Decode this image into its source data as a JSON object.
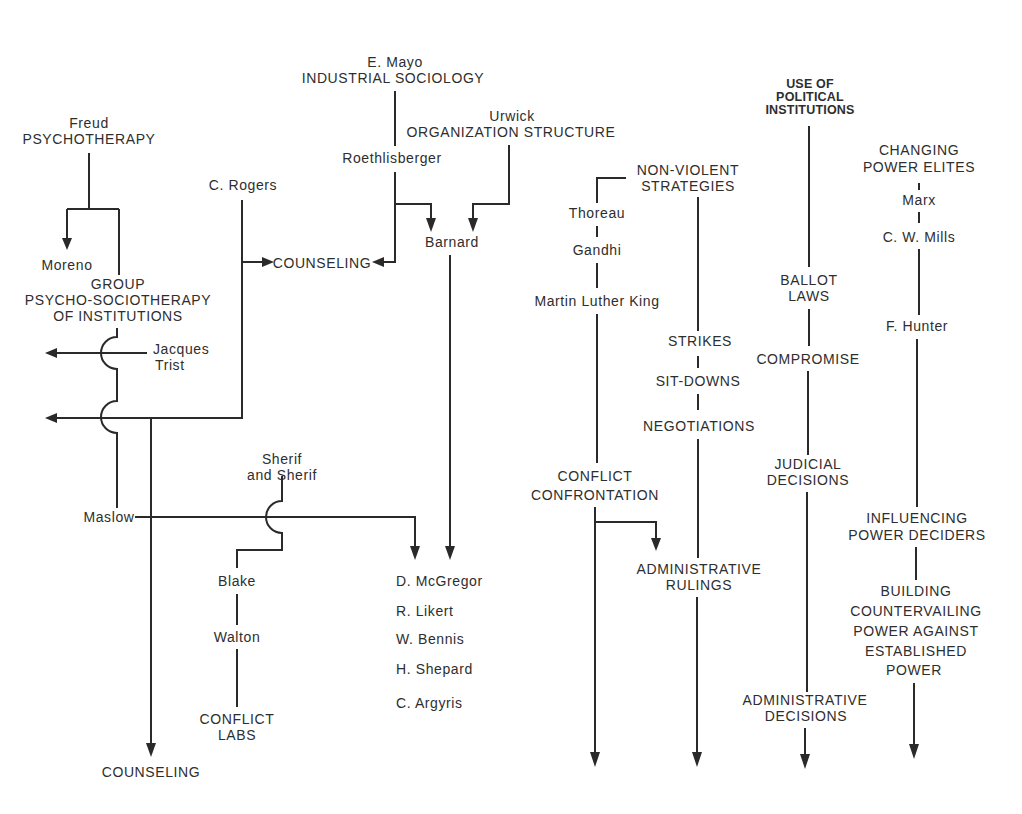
{
  "psychotherapy": {
    "origin_name": "Freud",
    "origin_field": "PSYCHOTHERAPY",
    "moreno": "Moreno",
    "group": [
      "GROUP",
      "PSYCHO-SOCIOTHERAPY",
      "OF INSTITUTIONS"
    ],
    "jacques_trist": [
      "Jacques",
      "Trist"
    ],
    "maslow": "Maslow",
    "counseling_bottom": "COUNSELING"
  },
  "rogers": {
    "name": "C. Rogers",
    "counseling": "COUNSELING"
  },
  "industrial_sociology": {
    "origin_name": "E. Mayo",
    "origin_field": "INDUSTRIAL SOCIOLOGY",
    "roethlisberger": "Roethlisberger"
  },
  "organization_structure": {
    "origin_name": "Urwick",
    "origin_field": "ORGANIZATION STRUCTURE",
    "barnard": "Barnard"
  },
  "conflict_labs": {
    "sherif": [
      "Sherif",
      "and Sherif"
    ],
    "blake": "Blake",
    "walton": "Walton",
    "outcome": [
      "CONFLICT",
      "LABS"
    ]
  },
  "human_relations_list": [
    "D. McGregor",
    "R. Likert",
    "W. Bennis",
    "H. Shepard",
    "C. Argyris"
  ],
  "non_violent": {
    "title": [
      "NON-VIOLENT",
      "STRATEGIES"
    ],
    "thoreau": "Thoreau",
    "gandhi": "Gandhi",
    "king": "Martin Luther King",
    "conflict_confrontation": [
      "CONFLICT",
      "CONFRONTATION"
    ],
    "strikes": "STRIKES",
    "sit_downs": "SIT-DOWNS",
    "negotiations": "NEGOTIATIONS",
    "administrative_rulings": [
      "ADMINISTRATIVE",
      "RULINGS"
    ]
  },
  "political_institutions": {
    "title": [
      "USE OF",
      "POLITICAL",
      "INSTITUTIONS"
    ],
    "ballot_laws": [
      "BALLOT",
      "LAWS"
    ],
    "compromise": "COMPROMISE",
    "judicial_decisions": [
      "JUDICIAL",
      "DECISIONS"
    ],
    "administrative_decisions": [
      "ADMINISTRATIVE",
      "DECISIONS"
    ]
  },
  "power_elites": {
    "title": [
      "CHANGING",
      "POWER ELITES"
    ],
    "marx": "Marx",
    "mills": "C. W. Mills",
    "hunter": "F. Hunter",
    "influencing": [
      "INFLUENCING",
      "POWER DECIDERS"
    ],
    "countervailing": [
      "BUILDING",
      "COUNTERVAILING",
      "POWER AGAINST",
      "ESTABLISHED",
      "POWER"
    ]
  }
}
